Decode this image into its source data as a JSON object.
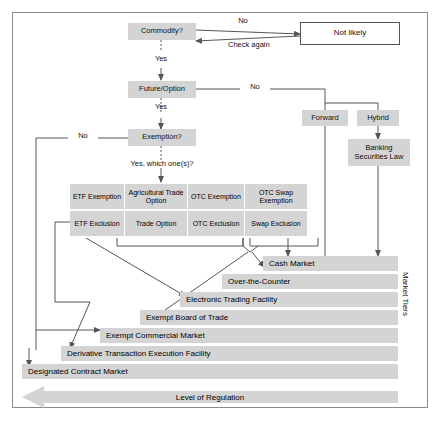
{
  "diagram": {
    "colors": {
      "node_fill": "#d4d4d4",
      "node_white_fill": "#ffffff",
      "line": "#555555",
      "frame": "#8a8a8a",
      "text": "#111111"
    },
    "decision_nodes": [
      {
        "id": "commodity",
        "label": "Commodity?"
      },
      {
        "id": "future_option",
        "label": "Future/Option"
      },
      {
        "id": "exemption",
        "label": "Exemption?"
      }
    ],
    "outcome_nodes": [
      {
        "id": "not_likely",
        "label": "Not likely"
      },
      {
        "id": "forward",
        "label": "Forward"
      },
      {
        "id": "hybrid",
        "label": "Hybrid"
      },
      {
        "id": "banking",
        "label": "Banking Securities Law"
      }
    ],
    "edge_labels": [
      {
        "id": "commodity_no",
        "label": "No"
      },
      {
        "id": "check_again",
        "label": "Check again"
      },
      {
        "id": "commodity_yes",
        "label": "Yes"
      },
      {
        "id": "future_yes",
        "label": "Yes"
      },
      {
        "id": "future_no",
        "label": "No"
      },
      {
        "id": "exemption_no",
        "label": "No"
      },
      {
        "id": "exemption_yes",
        "label": "Yes, which one(s)?"
      }
    ],
    "exemption_grid": {
      "row_exemption": [
        "ETF Exemption",
        "Agricultural Trade Option",
        "OTC Exemption",
        "OTC Swap Exemption"
      ],
      "row_exclusion": [
        "ETF Exclusion",
        "Trade Option",
        "OTC Exclusion",
        "Swap Exclusion"
      ]
    },
    "market_tiers": {
      "axis_label": "Market Tiers",
      "items": [
        "Cash Market",
        "Over-the-Counter",
        "Electronic Trading Facility",
        "Exempt Board of Trade",
        "Exempt Commercial Market",
        "Derivative Transaction Execution Facility",
        "Designated Contract Market"
      ]
    },
    "regulation_arrow": {
      "label": "Level of Regulation",
      "direction": "left"
    }
  }
}
